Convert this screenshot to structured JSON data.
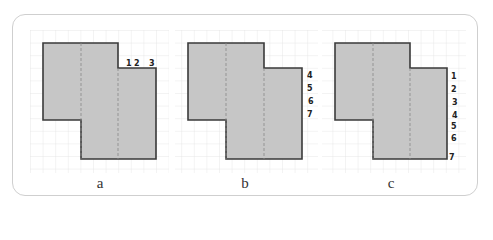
{
  "figure": {
    "panels": [
      {
        "id": "a",
        "caption": "a",
        "origin_x": 43,
        "labels": [
          {
            "text": "1",
            "x": 129,
            "y": 67,
            "position": "top-edge"
          },
          {
            "text": "2",
            "x": 137,
            "y": 67,
            "position": "top-edge"
          },
          {
            "text": "3",
            "x": 152,
            "y": 67,
            "position": "top-edge"
          }
        ]
      },
      {
        "id": "b",
        "caption": "b",
        "origin_x": 188,
        "labels": [
          {
            "text": "4",
            "x": 310,
            "y": 78,
            "position": "right-edge"
          },
          {
            "text": "5",
            "x": 310,
            "y": 91,
            "position": "right-edge"
          },
          {
            "text": "6",
            "x": 311,
            "y": 104,
            "position": "right-edge"
          },
          {
            "text": "7",
            "x": 310,
            "y": 118,
            "position": "right-edge"
          }
        ]
      },
      {
        "id": "c",
        "caption": "c",
        "origin_x": 335,
        "labels": [
          {
            "text": "1",
            "x": 453,
            "y": 79,
            "position": "right-edge"
          },
          {
            "text": "2",
            "x": 453,
            "y": 92,
            "position": "right-edge"
          },
          {
            "text": "3",
            "x": 454,
            "y": 104,
            "position": "right-edge"
          },
          {
            "text": "4",
            "x": 454,
            "y": 118,
            "position": "right-edge"
          },
          {
            "text": "5",
            "x": 453,
            "y": 128,
            "position": "right-edge"
          },
          {
            "text": "6",
            "x": 453,
            "y": 140,
            "position": "right-edge"
          },
          {
            "text": "7",
            "x": 450,
            "y": 160,
            "position": "right-edge"
          }
        ]
      }
    ],
    "colors": {
      "shape_fill": "#c6c6c6",
      "shape_stroke": "#3a3a3a",
      "grid": "#e2e2e2",
      "frame": "#cfcfcf"
    },
    "grid_cell_px": 12.6
  }
}
